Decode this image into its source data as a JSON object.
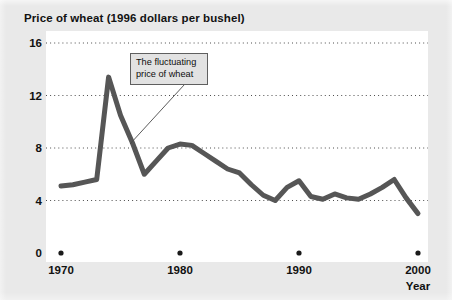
{
  "figure": {
    "title": "Price of wheat (1996 dollars per bushel)",
    "background_color": "#e9e9e9",
    "plot_background_color": "#ffffff"
  },
  "annotation": {
    "line1": "The fluctuating",
    "line2": "price of wheat",
    "box_fill": "#e2e2e2",
    "box_border": "#5f5f5f"
  },
  "chart_data": {
    "type": "line",
    "title": "Price of wheat (1996 dollars per bushel)",
    "xlabel": "Year",
    "ylabel": "",
    "xlim": [
      1970,
      2000
    ],
    "ylim": [
      0,
      16
    ],
    "yticks": [
      "16",
      "12",
      "8",
      "4",
      "0"
    ],
    "ytick_values": [
      16,
      12,
      8,
      4,
      0
    ],
    "xticks": [
      "1970",
      "1980",
      "1990",
      "2000"
    ],
    "xtick_values": [
      1970,
      1980,
      1990,
      2000
    ],
    "grid": "horizontal-dotted",
    "legend": "none",
    "line_color": "#565656",
    "line_width_px": 5,
    "series": [
      {
        "name": "Price of wheat",
        "x": [
          1970,
          1971,
          1972,
          1973,
          1974,
          1975,
          1976,
          1977,
          1978,
          1979,
          1980,
          1981,
          1982,
          1983,
          1984,
          1985,
          1986,
          1987,
          1988,
          1989,
          1990,
          1991,
          1992,
          1993,
          1994,
          1995,
          1996,
          1997,
          1998,
          1999,
          2000
        ],
        "y": [
          5.1,
          5.2,
          5.4,
          5.6,
          13.4,
          10.5,
          8.4,
          6.0,
          7.0,
          8.0,
          8.3,
          8.2,
          7.6,
          7.0,
          6.4,
          6.1,
          5.2,
          4.4,
          4.0,
          5.0,
          5.5,
          4.3,
          4.1,
          4.5,
          4.2,
          4.1,
          4.5,
          5.0,
          5.6,
          4.2,
          3.0
        ]
      }
    ],
    "annotations": [
      {
        "text": "The fluctuating price of wheat",
        "points_to_year": 1976
      }
    ]
  },
  "axis": {
    "x_title": "Year",
    "tick_marker_color": "#1a1a1a"
  }
}
